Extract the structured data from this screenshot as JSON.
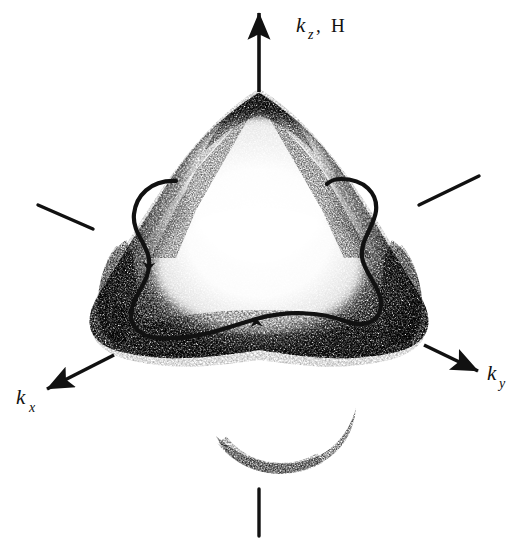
{
  "figure": {
    "background_color": "#ffffff",
    "ink_color": "#111111",
    "width": 524,
    "height": 545
  },
  "axes": [
    {
      "id": "kz",
      "name": "kz-axis",
      "symbol": "k",
      "subscript": "z",
      "separator": ",",
      "extra_symbol": "H",
      "label_text": "kz, H",
      "direction": "up",
      "label_x": 296,
      "label_y": 30,
      "arrow": {
        "x1": 259,
        "y1": 92,
        "x2": 259,
        "y2": 13
      }
    },
    {
      "id": "ky",
      "name": "ky-axis",
      "symbol": "k",
      "subscript": "y",
      "separator": "",
      "extra_symbol": "",
      "label_text": "ky",
      "direction": "down-right",
      "label_x": 487,
      "label_y": 380,
      "arrow": {
        "x1": 424,
        "y1": 345,
        "x2": 478,
        "y2": 371
      }
    },
    {
      "id": "kx",
      "name": "kx-axis",
      "symbol": "k",
      "subscript": "x",
      "separator": "",
      "extra_symbol": "",
      "label_text": "kx",
      "direction": "down-left",
      "label_x": 16,
      "label_y": 404,
      "arrow": {
        "x1": 114,
        "y1": 355,
        "x2": 47,
        "y2": 389
      }
    }
  ],
  "tick_marks": [
    {
      "name": "tick-upper-left",
      "x1": 38,
      "y1": 205,
      "x2": 93,
      "y2": 229
    },
    {
      "name": "tick-upper-right",
      "x1": 419,
      "y1": 205,
      "x2": 479,
      "y2": 176
    },
    {
      "name": "tick-bottom",
      "x1": 259,
      "y1": 489,
      "x2": 259,
      "y2": 536
    }
  ],
  "orbit": {
    "name": "cyclotron-orbit-contour",
    "closed": true,
    "stroke_width": 4.2,
    "description": "Closed extremal orbit traced on the Fermi surface waist",
    "arrowheads": [
      {
        "name": "orbit-arrow-left",
        "x": 148,
        "y": 271,
        "angle_deg": 96
      },
      {
        "name": "orbit-arrow-bottom",
        "x": 256,
        "y": 318,
        "angle_deg": 356
      }
    ],
    "path": "M 176 181 C 150 180 136 196 134 214 C 132 232 147 244 149 259 C 151 276 140 288 134 302 C 126 321 135 336 158 338 C 196 341 228 327 256 319 C 288 310 320 312 345 321 C 367 329 382 320 381 302 C 380 286 364 273 362 257 C 360 240 374 227 376 211 C 378 193 364 179 341 179 C 335 179 330 181 327 184"
  },
  "surface": {
    "name": "fermi-surface-body",
    "description": "Grainy halftone triangular body with rounded apex, flared lower corners and a faint crescent lobe below",
    "apex": {
      "x": 259,
      "y": 96
    },
    "left_corner": {
      "x": 101,
      "y": 330
    },
    "right_corner": {
      "x": 424,
      "y": 330
    },
    "lower_crescent": {
      "cx": 286,
      "cy": 450,
      "rx": 72,
      "ry": 40
    }
  }
}
